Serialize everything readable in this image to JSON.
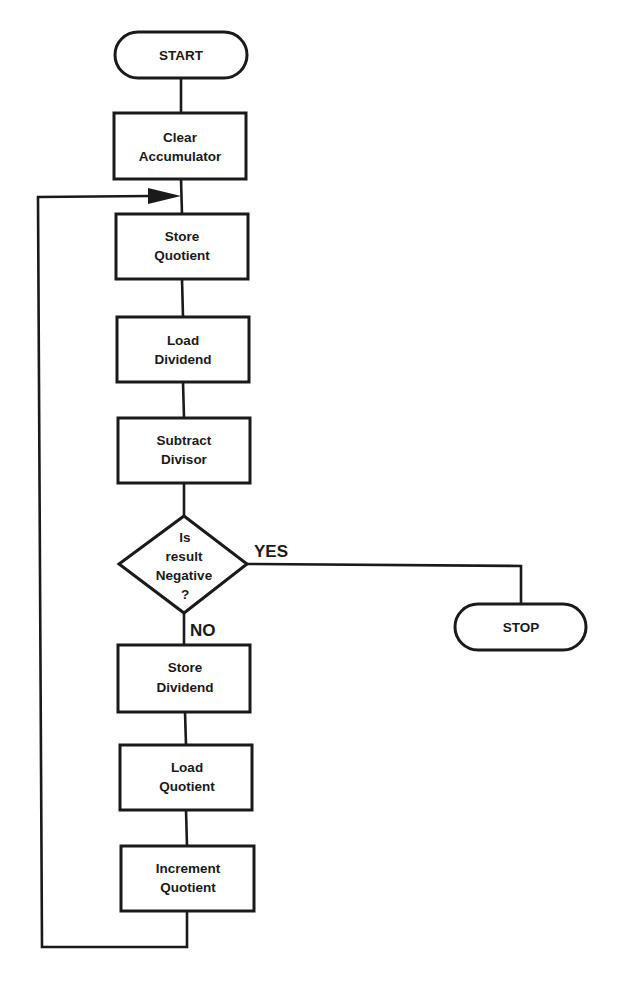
{
  "diagram": {
    "type": "flowchart",
    "nodes": [
      {
        "id": "start",
        "kind": "terminal",
        "lines": [
          "START"
        ]
      },
      {
        "id": "clear-accumulator",
        "kind": "process",
        "lines": [
          "Clear",
          "Accumulator"
        ]
      },
      {
        "id": "store-quotient",
        "kind": "process",
        "lines": [
          "Store",
          "Quotient"
        ]
      },
      {
        "id": "load-dividend",
        "kind": "process",
        "lines": [
          "Load",
          "Dividend"
        ]
      },
      {
        "id": "subtract-divisor",
        "kind": "process",
        "lines": [
          "Subtract",
          "Divisor"
        ]
      },
      {
        "id": "is-negative",
        "kind": "decision",
        "lines": [
          "Is",
          "result",
          "Negative",
          "?"
        ]
      },
      {
        "id": "stop",
        "kind": "terminal",
        "lines": [
          "STOP"
        ]
      },
      {
        "id": "store-dividend",
        "kind": "process",
        "lines": [
          "Store",
          "Dividend"
        ]
      },
      {
        "id": "load-quotient",
        "kind": "process",
        "lines": [
          "Load",
          "Quotient"
        ]
      },
      {
        "id": "increment-quotient",
        "kind": "process",
        "lines": [
          "Increment",
          "Quotient"
        ]
      }
    ],
    "edges": [
      {
        "from": "start",
        "to": "clear-accumulator"
      },
      {
        "from": "clear-accumulator",
        "to": "store-quotient"
      },
      {
        "from": "store-quotient",
        "to": "load-dividend"
      },
      {
        "from": "load-dividend",
        "to": "subtract-divisor"
      },
      {
        "from": "subtract-divisor",
        "to": "is-negative"
      },
      {
        "from": "is-negative",
        "to": "stop",
        "label": "YES"
      },
      {
        "from": "is-negative",
        "to": "store-dividend",
        "label": "NO"
      },
      {
        "from": "store-dividend",
        "to": "load-quotient"
      },
      {
        "from": "load-quotient",
        "to": "increment-quotient"
      },
      {
        "from": "increment-quotient",
        "to": "store-quotient",
        "loop": true
      }
    ],
    "branch_labels": {
      "yes": "YES",
      "no": "NO"
    }
  }
}
